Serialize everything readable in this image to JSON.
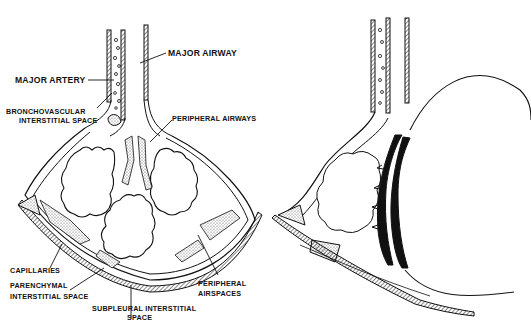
{
  "diagram": {
    "panels": [
      {
        "id": "left",
        "description": "normal lung lobule",
        "labels": {
          "major_airway": "MAJOR AIRWAY",
          "major_artery": "MAJOR ARTERY",
          "bronchovascular_1": "BRONCHOVASCULAR",
          "bronchovascular_2": "INTERSTITIAL SPACE",
          "peripheral_airways": "PERIPHERAL AIRWAYS",
          "capillaries": "CAPILLARIES",
          "parenchymal_1": "PARENCHYMAL",
          "parenchymal_2": "INTERSTITIAL  SPACE",
          "peripheral_airspaces_1": "PERIPHERAL",
          "peripheral_airspaces_2": "AIRSPACES",
          "subpleural_1": "SUBPLEURAL  INTERSTITIAL",
          "subpleural_2": "SPACE"
        }
      },
      {
        "id": "right",
        "description": "lobule with large cystic airspace and thickened wall",
        "labels": {}
      }
    ],
    "colors": {
      "ink": "#111111",
      "background": "#ffffff",
      "stipple": "#bdbdbd"
    }
  }
}
